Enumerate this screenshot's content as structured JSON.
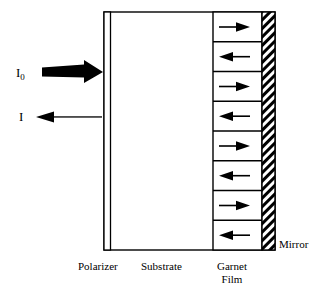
{
  "figure": {
    "type": "optical-magneto-optic-diagram",
    "background_color": "#ffffff",
    "line_color": "#000000"
  },
  "rays": [
    {
      "id": "incident",
      "label": "I",
      "subscript": "0",
      "direction": "right",
      "style": "thick-solid",
      "color": "#000000",
      "x": 16,
      "y": 66
    },
    {
      "id": "reflected",
      "label": "I",
      "subscript": "",
      "direction": "left",
      "style": "thin-solid",
      "color": "#000000",
      "x": 19,
      "y": 110
    }
  ],
  "layers": [
    {
      "id": "polarizer",
      "label": "Polarizer",
      "label_lines": [
        "Polarizer"
      ],
      "label_x": 78,
      "label_y": 260,
      "fill": "#ffffff"
    },
    {
      "id": "substrate",
      "label": "Substrate",
      "label_lines": [
        "Substrate"
      ],
      "label_x": 141,
      "label_y": 260,
      "fill": "#ffffff"
    },
    {
      "id": "garnet-film",
      "label": "Garnet Film",
      "label_lines": [
        "Garnet",
        "Film"
      ],
      "label_x": 210,
      "label_y": 260,
      "fill": "#ffffff"
    },
    {
      "id": "mirror",
      "label": "Mirror",
      "label_lines": [
        "Mirror"
      ],
      "label_x": 279,
      "label_y": 238,
      "fill": "hatched"
    }
  ],
  "garnet_domains": {
    "count": 8,
    "directions": [
      "right",
      "left",
      "right",
      "left",
      "right",
      "left",
      "right",
      "left"
    ],
    "arrow_color": "#000000"
  }
}
